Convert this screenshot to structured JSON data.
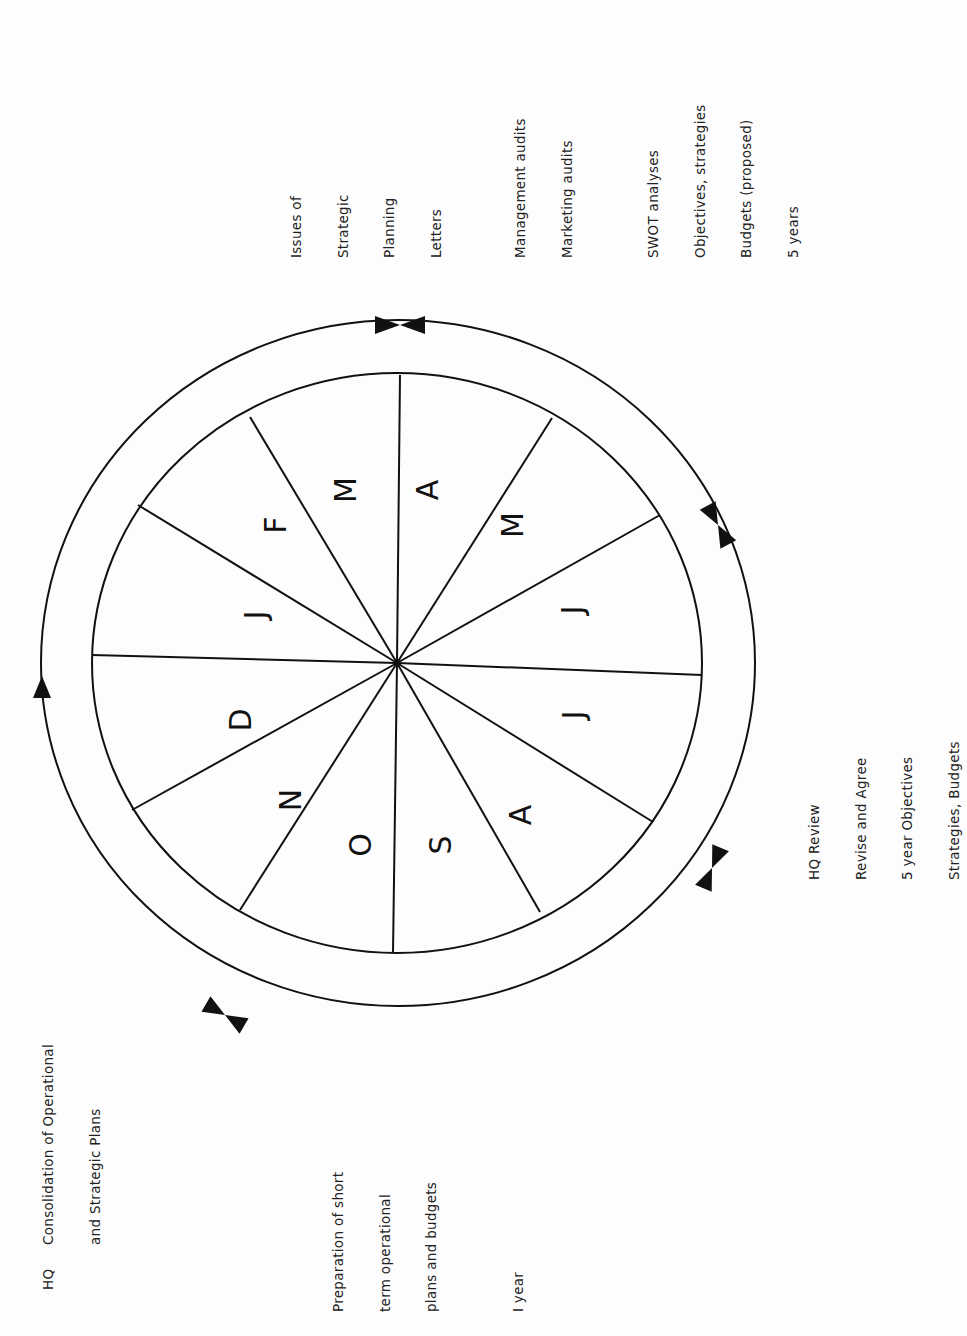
{
  "months": [
    "J",
    "F",
    "M",
    "A",
    "M",
    "J",
    "J",
    "A",
    "S",
    "O",
    "N",
    "D"
  ],
  "labels": {
    "issues": {
      "lines": [
        "Issues of",
        "Strategic",
        "Planning",
        "Letters"
      ]
    },
    "audits": {
      "group1": [
        "Management audits",
        "Marketing audits"
      ],
      "group2": [
        "SWOT analyses",
        "Objectives, strategies",
        "Budgets (proposed)",
        "5 years"
      ]
    },
    "hq_review": {
      "lines": [
        "HQ Review",
        "Revise and Agree",
        "5 year Objectives",
        "Strategies, Budgets"
      ]
    },
    "preparation": {
      "group1": [
        "Preparation of short",
        "term operational",
        "plans and budgets"
      ],
      "group2": [
        "I year"
      ]
    },
    "consolidation": {
      "prefix": "HQ",
      "lines": [
        "Consolidation of Operational",
        "and Strategic Plans"
      ]
    }
  },
  "colors": {
    "line": "#111111",
    "background": "#fdfdfd"
  }
}
